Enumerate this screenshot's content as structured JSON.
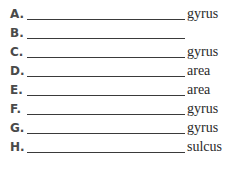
{
  "items": [
    {
      "letter": "A.",
      "suffix": "gyrus"
    },
    {
      "letter": "B.",
      "suffix": ""
    },
    {
      "letter": "C.",
      "suffix": "gyrus"
    },
    {
      "letter": "D.",
      "suffix": "area"
    },
    {
      "letter": "E.",
      "suffix": "area"
    },
    {
      "letter": "F.",
      "suffix": "gyrus"
    },
    {
      "letter": "G.",
      "suffix": "gyrus"
    },
    {
      "letter": "H.",
      "suffix": "sulcus"
    }
  ]
}
